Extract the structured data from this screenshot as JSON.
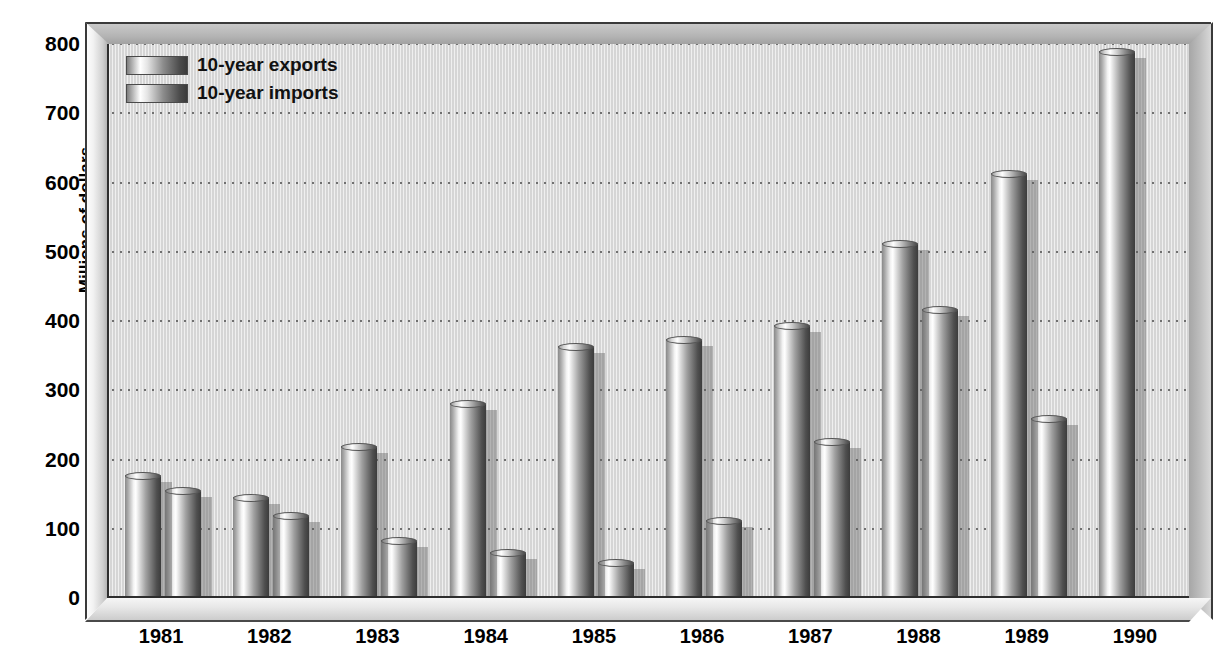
{
  "chart_data": {
    "type": "bar",
    "title": "",
    "xlabel": "",
    "ylabel": "Millions of dollars",
    "categories": [
      "1981",
      "1982",
      "1983",
      "1984",
      "1985",
      "1986",
      "1987",
      "1988",
      "1989",
      "1990"
    ],
    "series": [
      {
        "name": "10-year exports",
        "values": [
          173,
          142,
          215,
          278,
          360,
          370,
          390,
          508,
          610,
          785
        ]
      },
      {
        "name": "10-year imports",
        "values": [
          152,
          115,
          80,
          62,
          48,
          108,
          222,
          413,
          255,
          0
        ]
      }
    ],
    "ylim": [
      0,
      800
    ],
    "yticks": [
      0,
      100,
      200,
      300,
      400,
      500,
      600,
      700,
      800
    ],
    "ytick_labels": [
      "0",
      "100",
      "200",
      "300",
      "400",
      "500",
      "600",
      "700",
      "800"
    ],
    "grid": true,
    "legend_position": "top-left",
    "colors": {
      "background": "#dcdcdc",
      "frame": "#b4b4b4",
      "axis": "#2e2e2e",
      "gridline": "#6a6a6a",
      "bar_light": "#ffffff",
      "bar_dark": "#3c3c3c"
    }
  },
  "legend": {
    "items": [
      {
        "label": "10-year exports"
      },
      {
        "label": "10-year imports"
      }
    ]
  },
  "axes": {
    "y_title": "Millions of dollars"
  }
}
